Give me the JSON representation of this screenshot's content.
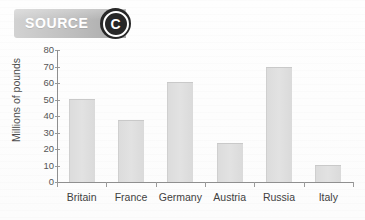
{
  "banner": {
    "label": "SOURCE",
    "badge_letter": "C",
    "badge_icon": "source-letter-badge"
  },
  "chart_data": {
    "type": "bar",
    "title": "",
    "xlabel": "",
    "ylabel": "Millions of pounds",
    "categories": [
      "Britain",
      "France",
      "Germany",
      "Austria",
      "Russia",
      "Italy"
    ],
    "values": [
      50,
      37,
      60,
      23,
      69,
      10
    ],
    "ytick_labels": [
      "0",
      "10",
      "20",
      "30",
      "40",
      "50",
      "60",
      "70",
      "80"
    ],
    "ytick_values": [
      0,
      10,
      20,
      30,
      40,
      50,
      60,
      70,
      80
    ],
    "ylim": [
      0,
      80
    ],
    "grid": false,
    "legend": null,
    "series": [
      {
        "name": "Millions of pounds",
        "values": [
          50,
          37,
          60,
          23,
          69,
          10
        ]
      }
    ]
  },
  "colors": {
    "bar_fill": "#e0e0e0",
    "bar_edge": "#c9c9c9",
    "axis": "#8f8f8f",
    "banner_gradient_start": "#d2d2d2",
    "banner_gradient_end": "#a8a8a8",
    "badge_circle": "#272727",
    "text": "#3f3f3f",
    "background": "#fdfdfd"
  }
}
